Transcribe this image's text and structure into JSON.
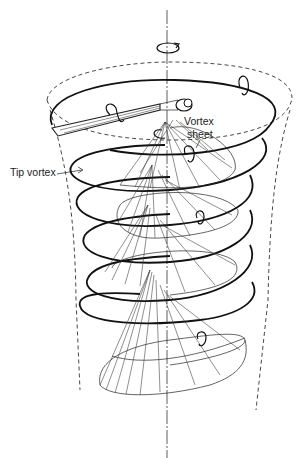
{
  "figure": {
    "labels": {
      "tip_vortex": "Tip vortex",
      "vortex_sheet_line1": "Vortex",
      "vortex_sheet_line2": "sheet"
    },
    "elements": [
      {
        "name": "rotation-axis",
        "style": "dash-dot"
      },
      {
        "name": "slipstream-boundary",
        "style": "dashed"
      },
      {
        "name": "tip-vortex-helix",
        "style": "thick solid",
        "turns": 5
      },
      {
        "name": "vortex-sheet-cones",
        "count": 4
      },
      {
        "name": "rotor-blade-and-hub"
      },
      {
        "name": "rotation-arrows",
        "count": 6
      }
    ],
    "colors": {
      "background": "#ffffff",
      "ink": "#111111"
    }
  }
}
